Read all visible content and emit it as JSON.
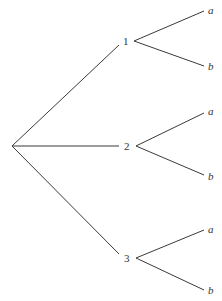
{
  "diagram": {
    "type": "tree",
    "root": {
      "label": ""
    },
    "nodes": [
      {
        "label": "1",
        "children": [
          {
            "label": "a"
          },
          {
            "label": "b"
          }
        ]
      },
      {
        "label": "2",
        "children": [
          {
            "label": "a"
          },
          {
            "label": "b"
          }
        ]
      },
      {
        "label": "3",
        "children": [
          {
            "label": "a"
          },
          {
            "label": "b"
          }
        ]
      }
    ],
    "colors": {
      "line": "#3a3a3a",
      "text": "#333333",
      "background": "#ffffff"
    }
  }
}
